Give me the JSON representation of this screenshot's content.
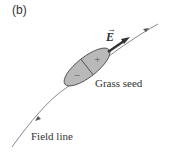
{
  "figure": {
    "panel_label": "(b)",
    "vector_label": "E",
    "seed_label": "Grass seed",
    "line_label": "Field line",
    "plus_sign": "+",
    "minus_sign": "−",
    "colors": {
      "seed_fill": "#b9b9b9",
      "stroke": "#444444",
      "line": "#6a6a6a"
    }
  }
}
